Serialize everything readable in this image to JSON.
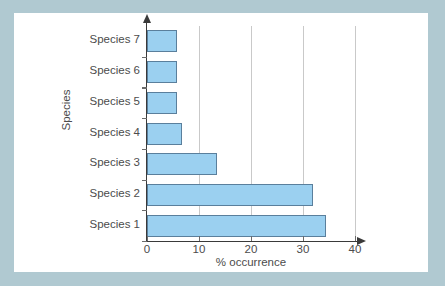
{
  "figure": {
    "panel_background": "#ffffff",
    "mat_background": "#b0c9d1"
  },
  "chart_data": {
    "type": "bar",
    "orientation": "horizontal",
    "title": "",
    "xlabel": "% occurrence",
    "ylabel": "Species",
    "categories": [
      "Species 1",
      "Species 2",
      "Species 3",
      "Species 4",
      "Species 5",
      "Species 6",
      "Species 7"
    ],
    "values": [
      34.5,
      32,
      13.5,
      6.7,
      5.8,
      5.8,
      5.8
    ],
    "xlim": [
      0,
      40
    ],
    "xticks": [
      0,
      10,
      20,
      30,
      40
    ],
    "xtick_labels": [
      "0",
      "10",
      "20",
      "30",
      "40"
    ],
    "grid": "vertical-gridlines-at-10-20-30-40",
    "legend": "none",
    "bar_color": "#9bd0f0",
    "bar_border_color": "#5a7f9c",
    "axis_color": "#3a3a3a",
    "gridline_color": "#c9c9c9",
    "text_color": "#4c4c4c"
  }
}
